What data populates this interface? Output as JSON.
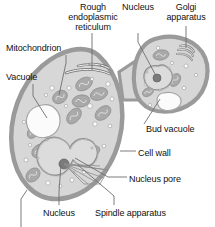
{
  "figure": {
    "background_color": "#ffffff",
    "text_color": "#111111",
    "cell_wall_color": "#9a9a9a",
    "cytoplasm_color": "#d7d7d7",
    "organelle_color": "#a9a9a9",
    "vacuole_color": "#fbfbfb",
    "leader_line_color": "#6e6e6e"
  },
  "labels": [
    {
      "id": "rough-er",
      "text": "Rough\nendoplasmic\nreticulum",
      "x": 62,
      "y": 2,
      "w": 62,
      "align": "center"
    },
    {
      "id": "nucleus-bud",
      "text": "Nucleus",
      "x": 118,
      "y": 2,
      "w": 40,
      "align": "center"
    },
    {
      "id": "golgi-apparatus",
      "text": "Golgi\napparatus",
      "x": 159,
      "y": 2,
      "w": 54,
      "align": "center"
    },
    {
      "id": "mitochondrion",
      "text": "Mitochondrion",
      "x": 6,
      "y": 43,
      "w": 70,
      "align": "left"
    },
    {
      "id": "vacuole",
      "text": "Vacuole",
      "x": 6,
      "y": 72,
      "w": 42,
      "align": "left"
    },
    {
      "id": "bud-vacuole",
      "text": "Bud vacuole",
      "x": 146,
      "y": 124,
      "w": 62,
      "align": "left"
    },
    {
      "id": "cell-wall",
      "text": "Cell wall",
      "x": 138,
      "y": 148,
      "w": 46,
      "align": "left"
    },
    {
      "id": "nucleus-pore",
      "text": "Nucleus pore",
      "x": 129,
      "y": 174,
      "w": 66,
      "align": "left"
    },
    {
      "id": "nucleus-main",
      "text": "Nucleus",
      "x": 43,
      "y": 208,
      "w": 42,
      "align": "left"
    },
    {
      "id": "spindle-apparatus",
      "text": "Spindle apparatus",
      "x": 95,
      "y": 208,
      "w": 88,
      "align": "left"
    }
  ],
  "leader_lines": [
    {
      "id": "leader-rough-er",
      "points": "92,33 92,70"
    },
    {
      "id": "leader-nucleus-bud",
      "points": "138,33 138,42 155,74"
    },
    {
      "id": "leader-golgi-apparatus",
      "points": "186,26 186,48"
    },
    {
      "id": "leader-mitochondrion",
      "points": "66,55 66,63 59,95"
    },
    {
      "id": "leader-vacuole",
      "points": "33,84 33,96 47,118"
    },
    {
      "id": "leader-bud-vacuole",
      "points": "144,124 160,99"
    },
    {
      "id": "leader-cell-wall",
      "points": "136,151 120,151"
    },
    {
      "id": "leader-nucleus-pore",
      "points": "127,177 108,177 75,158"
    },
    {
      "id": "leader-nucleus-main",
      "points": "59,205 59,192 61,164"
    },
    {
      "id": "leader-spindle-apparatus",
      "points": "114,205 114,196 78,165"
    },
    {
      "id": "leader-unlabeled-bottom",
      "points": "21,227 21,199 27,190"
    }
  ],
  "cell_structures": {
    "mother_cell": {
      "name": "mother-cell",
      "outline": "M 98,55 C 118,73 128,107 119,141 C 110,176 84,198 58,199 C 34,200 16,180 12,150 C 8,118 20,85 42,66 C 62,49 84,44 98,55 Z"
    },
    "bud_cell": {
      "name": "bud-cell",
      "outline": "M 150,41 C 170,32 192,38 202,52 C 212,67 208,90 193,102 C 176,115 152,115 141,102 C 129,88 132,52 150,41 Z"
    },
    "neck": {
      "name": "cell-neck",
      "outline": "M 119,72 L 143,56 L 148,100 L 123,100 Z"
    },
    "main_nucleus": {
      "name": "main-nucleus",
      "outline": "M 63,140 C 53,133 39,140 37,152 C 35,166 46,177 58,175 C 66,174 70,166 73,160 C 78,166 88,169 94,162 C 101,153 96,141 86,139 C 78,137 72,143 70,148 C 69,145 67,142 63,140 Z",
      "nucleolus": {
        "cx": 64,
        "cy": 164,
        "r": 5
      }
    },
    "bud_nucleus": {
      "name": "bud-nucleus",
      "outline": "M 158,66 C 150,64 143,70 144,78 C 145,87 154,92 162,89 C 172,86 175,76 170,70 C 166,65 162,64 158,66 Z",
      "nucleolus": {
        "cx": 157,
        "cy": 78,
        "r": 4
      }
    },
    "main_vacuole": {
      "name": "main-vacuole",
      "outline": "M 42,105 C 53,103 61,112 60,122 C 59,133 49,140 38,137 C 28,134 24,123 28,114 C 31,108 36,106 42,105 Z"
    },
    "bud_vacuole": {
      "name": "bud-vacuole",
      "outline": "M 163,93 C 173,91 181,95 181,101 C 181,108 172,112 164,110 C 156,108 154,95 163,93 Z"
    },
    "rough_er_arcs": [
      "M 66,73 C 80,68 97,68 110,74",
      "M 78,66 C 92,63 107,65 118,72",
      "M 90,64 C 102,64 113,68 120,76",
      "M 101,65 C 111,68 119,74 123,82"
    ],
    "golgi_arcs": [
      "M 180,46 C 186,44 192,47 194,52",
      "M 178,50 C 185,48 191,51 193,56",
      "M 177,54 C 184,53 190,56 192,60"
    ],
    "mitochondria": [
      {
        "cx": 60,
        "cy": 97,
        "rx": 8,
        "ry": 6,
        "rot": -35
      },
      {
        "cx": 84,
        "cy": 84,
        "rx": 9,
        "ry": 6,
        "rot": -30
      },
      {
        "cx": 81,
        "cy": 101,
        "rx": 9,
        "ry": 6,
        "rot": -10
      },
      {
        "cx": 74,
        "cy": 116,
        "rx": 9,
        "ry": 6,
        "rot": -50
      },
      {
        "cx": 99,
        "cy": 94,
        "rx": 9,
        "ry": 6,
        "rot": -20
      },
      {
        "cx": 103,
        "cy": 113,
        "rx": 9,
        "ry": 6,
        "rot": -40
      },
      {
        "cx": 39,
        "cy": 151,
        "rx": 8,
        "ry": 6,
        "rot": -40
      },
      {
        "cx": 33,
        "cy": 175,
        "rx": 8,
        "ry": 6,
        "rot": -45
      },
      {
        "cx": 33,
        "cy": 132,
        "rx": 7,
        "ry": 5,
        "rot": -55
      },
      {
        "cx": 93,
        "cy": 151,
        "rx": 7,
        "ry": 5,
        "rot": -25
      },
      {
        "cx": 161,
        "cy": 55,
        "rx": 8,
        "ry": 5,
        "rot": -10
      },
      {
        "cx": 175,
        "cy": 80,
        "rx": 7,
        "ry": 5,
        "rot": -55
      },
      {
        "cx": 148,
        "cy": 92,
        "rx": 6,
        "ry": 4,
        "rot": -30
      }
    ],
    "vesicles": [
      {
        "cx": 52,
        "cy": 88,
        "r": 2.2
      },
      {
        "cx": 46,
        "cy": 95,
        "r": 1.6
      },
      {
        "cx": 69,
        "cy": 88,
        "r": 2.0
      },
      {
        "cx": 92,
        "cy": 79,
        "r": 1.6
      },
      {
        "cx": 108,
        "cy": 84,
        "r": 2.2
      },
      {
        "cx": 112,
        "cy": 99,
        "r": 2.0
      },
      {
        "cx": 90,
        "cy": 106,
        "r": 2.4
      },
      {
        "cx": 95,
        "cy": 124,
        "r": 2.2
      },
      {
        "cx": 110,
        "cy": 126,
        "r": 1.8
      },
      {
        "cx": 66,
        "cy": 106,
        "r": 1.6
      },
      {
        "cx": 52,
        "cy": 143,
        "r": 1.8
      },
      {
        "cx": 30,
        "cy": 145,
        "r": 1.6
      },
      {
        "cx": 26,
        "cy": 160,
        "r": 2.0
      },
      {
        "cx": 44,
        "cy": 166,
        "r": 1.8
      },
      {
        "cx": 48,
        "cy": 183,
        "r": 2.2
      },
      {
        "cx": 60,
        "cy": 186,
        "r": 1.8
      },
      {
        "cx": 72,
        "cy": 180,
        "r": 2.0
      },
      {
        "cx": 84,
        "cy": 172,
        "r": 1.8
      },
      {
        "cx": 92,
        "cy": 163,
        "r": 1.6
      },
      {
        "cx": 104,
        "cy": 146,
        "r": 1.8
      },
      {
        "cx": 24,
        "cy": 122,
        "r": 1.6
      },
      {
        "cx": 158,
        "cy": 48,
        "r": 1.8
      },
      {
        "cx": 172,
        "cy": 63,
        "r": 1.6
      },
      {
        "cx": 186,
        "cy": 66,
        "r": 2.0
      },
      {
        "cx": 148,
        "cy": 70,
        "r": 1.6
      },
      {
        "cx": 146,
        "cy": 84,
        "r": 1.8
      },
      {
        "cx": 164,
        "cy": 101,
        "r": 1.6
      },
      {
        "cx": 184,
        "cy": 88,
        "r": 1.8
      },
      {
        "cx": 150,
        "cy": 105,
        "r": 1.6
      },
      {
        "cx": 196,
        "cy": 75,
        "r": 1.6
      }
    ]
  }
}
